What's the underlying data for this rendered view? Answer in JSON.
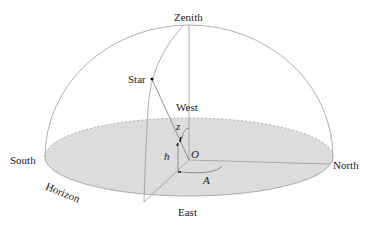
{
  "diagram": {
    "labels": {
      "zenith": "Zenith",
      "star": "Star",
      "west": "West",
      "south": "South",
      "north": "North",
      "east": "East",
      "horizon": "Horizon",
      "origin": "O",
      "zenith_distance": "z",
      "altitude": "h",
      "azimuth": "A"
    },
    "colors": {
      "line": "#9a9a9a",
      "dark_line": "#555555",
      "horizon_fill": "#dcdcdc",
      "text": "#1a1a1a",
      "point": "#111111"
    }
  }
}
